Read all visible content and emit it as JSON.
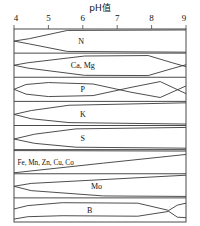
{
  "chart_data": {
    "type": "area",
    "title": "pH值",
    "xlabel": "pH值",
    "ylabel": "",
    "xlim": [
      4,
      9
    ],
    "ticks": [
      "4",
      "5",
      "6",
      "7",
      "8",
      "9"
    ],
    "grid": false,
    "legend": "none",
    "series": [
      {
        "name": "N",
        "label": "N",
        "label_anchor": "middle",
        "label_x": 5.95,
        "top": [
          [
            4,
            0.5
          ],
          [
            4.45,
            0.4
          ],
          [
            5.55,
            0.06
          ],
          [
            9,
            0.04
          ]
        ],
        "bottom": [
          [
            4,
            0.5
          ],
          [
            4.45,
            0.62
          ],
          [
            5.55,
            0.93
          ],
          [
            9,
            0.96
          ]
        ]
      },
      {
        "name": "Ca, Mg",
        "label": "Ca, Mg",
        "label_anchor": "middle",
        "label_x": 6.0,
        "top": [
          [
            4,
            0.5
          ],
          [
            4.4,
            0.4
          ],
          [
            6.05,
            0.12
          ],
          [
            7.9,
            0.1
          ],
          [
            8.6,
            0.4
          ],
          [
            9,
            0.56
          ]
        ],
        "bottom": [
          [
            4,
            0.5
          ],
          [
            4.4,
            0.62
          ],
          [
            6.05,
            0.92
          ],
          [
            7.9,
            0.93
          ],
          [
            8.6,
            0.64
          ],
          [
            9,
            0.48
          ]
        ]
      },
      {
        "name": "P",
        "label": "P",
        "label_anchor": "middle",
        "label_x": 6.0,
        "top": [
          [
            4,
            0.5
          ],
          [
            4.35,
            0.3
          ],
          [
            5.0,
            0.22
          ],
          [
            6.3,
            0.28
          ],
          [
            7.4,
            0.62
          ],
          [
            8.25,
            0.84
          ],
          [
            9,
            0.36
          ]
        ],
        "bottom": [
          [
            4,
            0.5
          ],
          [
            4.35,
            0.7
          ],
          [
            5.0,
            0.8
          ],
          [
            6.3,
            0.76
          ],
          [
            7.4,
            0.42
          ],
          [
            8.25,
            0.18
          ],
          [
            9,
            0.68
          ]
        ]
      },
      {
        "name": "K",
        "label": "K",
        "label_anchor": "middle",
        "label_x": 6.0,
        "top": [
          [
            4,
            0.54
          ],
          [
            4.5,
            0.38
          ],
          [
            5.6,
            0.16
          ],
          [
            9,
            0.06
          ]
        ],
        "bottom": [
          [
            4,
            0.54
          ],
          [
            4.5,
            0.72
          ],
          [
            5.6,
            0.88
          ],
          [
            9,
            0.94
          ]
        ]
      },
      {
        "name": "S",
        "label": "S",
        "label_anchor": "middle",
        "label_x": 6.0,
        "top": [
          [
            4,
            0.56
          ],
          [
            4.6,
            0.36
          ],
          [
            5.8,
            0.14
          ],
          [
            9,
            0.08
          ]
        ],
        "bottom": [
          [
            4,
            0.56
          ],
          [
            4.6,
            0.74
          ],
          [
            5.8,
            0.9
          ],
          [
            9,
            0.94
          ]
        ]
      },
      {
        "name": "Fe, Mn, Zn, Cu, Co",
        "label": "Fe, Mn, Zn, Cu, Co",
        "label_anchor": "start",
        "label_x": 4.1,
        "top": [
          [
            4,
            0.04
          ],
          [
            9,
            0.06
          ]
        ],
        "bottom": [
          [
            4,
            0.96
          ],
          [
            6.6,
            0.56
          ],
          [
            9,
            0.2
          ]
        ]
      },
      {
        "name": "Mo",
        "label": "Mo",
        "label_anchor": "middle",
        "label_x": 6.4,
        "top": [
          [
            4,
            0.52
          ],
          [
            4.5,
            0.4
          ],
          [
            9,
            0.06
          ]
        ],
        "bottom": [
          [
            4,
            0.52
          ],
          [
            4.5,
            0.7
          ],
          [
            6.6,
            0.92
          ],
          [
            9,
            0.94
          ]
        ]
      },
      {
        "name": "B",
        "label": "B",
        "label_anchor": "middle",
        "label_x": 6.2,
        "top": [
          [
            4,
            0.46
          ],
          [
            4.4,
            0.32
          ],
          [
            5.4,
            0.2
          ],
          [
            7.6,
            0.22
          ],
          [
            8.5,
            0.52
          ],
          [
            8.75,
            0.3
          ],
          [
            9,
            0.22
          ]
        ],
        "bottom": [
          [
            4,
            0.88
          ],
          [
            4.4,
            0.78
          ],
          [
            5.4,
            0.74
          ],
          [
            7.6,
            0.76
          ],
          [
            8.5,
            0.56
          ],
          [
            8.75,
            0.8
          ],
          [
            9,
            0.82
          ]
        ]
      }
    ]
  },
  "colors": {
    "line": "#3a3a3a",
    "frame": "#4a4a4a",
    "text": "#111111",
    "background": "#ffffff"
  }
}
